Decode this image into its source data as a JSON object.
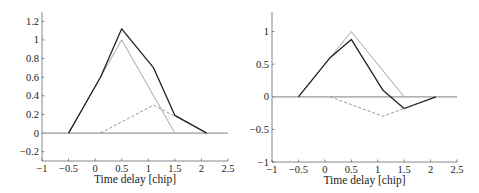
{
  "chart_data": [
    {
      "type": "line",
      "title": "",
      "xlabel": "Time delay [chip]",
      "ylabel": "",
      "xlim": [
        -1,
        2.5
      ],
      "ylim": [
        -0.3,
        1.3
      ],
      "grid": false,
      "xticks": [
        -1,
        -0.5,
        0,
        0.5,
        1,
        1.5,
        2,
        2.5
      ],
      "xtick_labels": [
        "−1",
        "−0.5",
        "0",
        "0.5",
        "1",
        "1.5",
        "2",
        "2.5"
      ],
      "yticks": [
        -0.2,
        0,
        0.2,
        0.4,
        0.6,
        0.8,
        1,
        1.2
      ],
      "ytick_labels": [
        "−0.2",
        "0",
        "0.2",
        "0.4",
        "0.6",
        "0.8",
        "1",
        "1.2"
      ],
      "series": [
        {
          "name": "zero line",
          "style": "solid",
          "color": "#999999",
          "x": [
            -1,
            2.5
          ],
          "y": [
            0,
            0
          ]
        },
        {
          "name": "direct path",
          "style": "solid",
          "color": "#9a9a9a",
          "x": [
            -0.5,
            0.5,
            1.5
          ],
          "y": [
            0,
            1,
            0
          ]
        },
        {
          "name": "multipath",
          "style": "dashed",
          "color": "#8a8a8a",
          "x": [
            0.1,
            1.1,
            2.1
          ],
          "y": [
            0,
            0.3,
            0
          ]
        },
        {
          "name": "composite",
          "style": "solid",
          "color": "#222222",
          "x": [
            -0.5,
            0.1,
            0.5,
            1.1,
            1.5,
            2.1
          ],
          "y": [
            0,
            0.6,
            1.12,
            0.7,
            0.19,
            0
          ]
        }
      ]
    },
    {
      "type": "line",
      "title": "",
      "xlabel": "Time delay [chip]",
      "ylabel": "",
      "xlim": [
        -1,
        2.5
      ],
      "ylim": [
        -1,
        1.3
      ],
      "grid": false,
      "xticks": [
        -1,
        -0.5,
        0,
        0.5,
        1,
        1.5,
        2,
        2.5
      ],
      "xtick_labels": [
        "−1",
        "−0.5",
        "0",
        "0.5",
        "1",
        "1.5",
        "2",
        "2.5"
      ],
      "yticks": [
        -1,
        -0.5,
        0,
        0.5,
        1
      ],
      "ytick_labels": [
        "−1",
        "−0.5",
        "0",
        "0.5",
        "1"
      ],
      "series": [
        {
          "name": "zero line",
          "style": "solid",
          "color": "#999999",
          "x": [
            -1,
            2.5
          ],
          "y": [
            0,
            0
          ]
        },
        {
          "name": "direct path",
          "style": "solid",
          "color": "#9a9a9a",
          "x": [
            -0.5,
            0.5,
            1.5
          ],
          "y": [
            0,
            1,
            0
          ]
        },
        {
          "name": "multipath",
          "style": "dashed",
          "color": "#8a8a8a",
          "x": [
            0.1,
            1.1,
            2.1
          ],
          "y": [
            0,
            -0.3,
            0
          ]
        },
        {
          "name": "composite",
          "style": "solid",
          "color": "#222222",
          "x": [
            -0.5,
            0.1,
            0.5,
            1.1,
            1.5,
            2.1
          ],
          "y": [
            0,
            0.6,
            0.88,
            0.1,
            -0.18,
            0
          ]
        }
      ]
    }
  ],
  "layout": {
    "plots": [
      {
        "x0": 42,
        "x1": 228,
        "y_top": 12,
        "y_bottom": 161
      },
      {
        "x0": 272,
        "x1": 457,
        "y_top": 12,
        "y_bottom": 162
      }
    ]
  }
}
